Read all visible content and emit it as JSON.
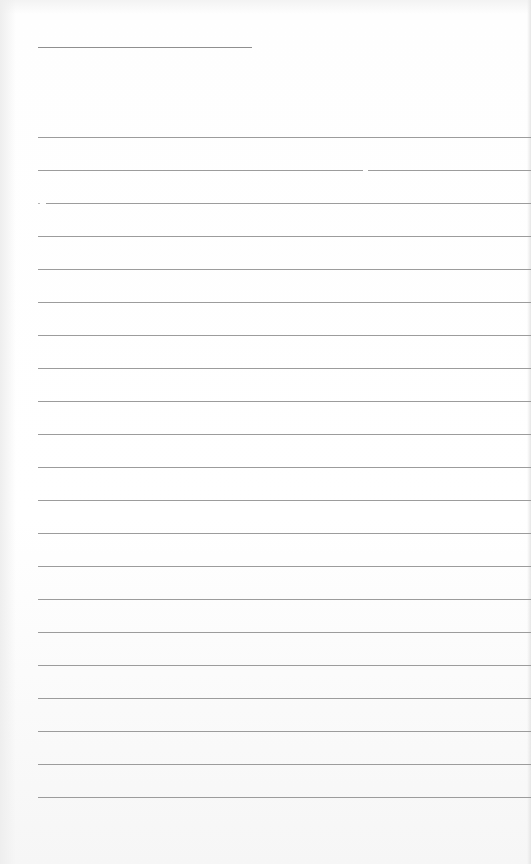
{
  "page": {
    "type": "blank lined writing sheet",
    "background_color": "#ffffff",
    "line_color": "#9c9c9c"
  },
  "title_line": {
    "top": 47,
    "left": 38,
    "width": 214
  },
  "ruled_lines": {
    "count": 21,
    "first_top": 137,
    "spacing": 33,
    "left": 38,
    "split_line_index": 1
  }
}
